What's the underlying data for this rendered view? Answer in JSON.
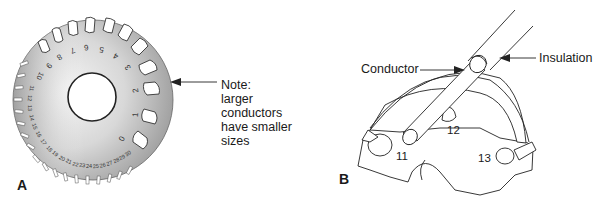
{
  "panel_a": {
    "letter": "A",
    "note_lines": [
      "Note:",
      "larger conductors",
      "have smaller",
      "sizes"
    ],
    "gauge_numbers": [
      "0",
      "1",
      "2",
      "3",
      "4",
      "5",
      "6",
      "7",
      "8",
      "9",
      "10",
      "11",
      "12",
      "13",
      "14",
      "15",
      "16",
      "17",
      "18",
      "19",
      "20",
      "21",
      "22",
      "23",
      "24",
      "25",
      "26",
      "27",
      "28",
      "29",
      "30"
    ]
  },
  "panel_b": {
    "letter": "B",
    "labels": {
      "conductor": "Conductor",
      "insulation": "Insulation"
    },
    "hole_numbers": [
      "11",
      "12",
      "13"
    ]
  }
}
